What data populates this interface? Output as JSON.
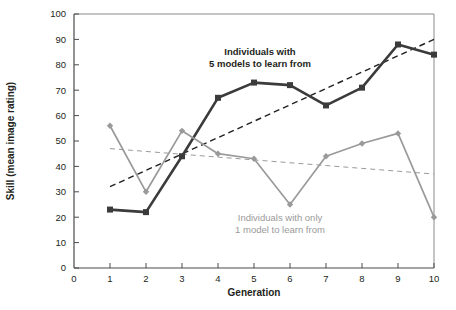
{
  "chart_data": {
    "type": "line",
    "title": "",
    "xlabel": "Generation",
    "ylabel": "Skill (mean image rating)",
    "x": [
      1,
      2,
      3,
      4,
      5,
      6,
      7,
      8,
      9,
      10
    ],
    "xlim": [
      0,
      10
    ],
    "ylim": [
      0,
      100
    ],
    "xticks": [
      "0",
      "1",
      "2",
      "3",
      "4",
      "5",
      "6",
      "7",
      "8",
      "9",
      "10"
    ],
    "yticks": [
      "0",
      "10",
      "20",
      "30",
      "40",
      "50",
      "60",
      "70",
      "80",
      "90",
      "100"
    ],
    "grid": false,
    "legend_position": "inline-annotations",
    "series": [
      {
        "name": "Individuals with 5 models to learn from",
        "color": "#3b3b3b",
        "marker": "square",
        "values": [
          23,
          22,
          44,
          67,
          73,
          72,
          64,
          71,
          88,
          84
        ]
      },
      {
        "name": "Individuals with only 1 model to learn from",
        "color": "#9a9a9a",
        "marker": "diamond",
        "values": [
          56,
          30,
          54,
          45,
          43,
          25,
          44,
          49,
          53,
          20
        ]
      }
    ],
    "trendlines": [
      {
        "name": "trend-5-models",
        "color": "#231f20",
        "style": "dashed",
        "x_start": 1,
        "y_start": 32,
        "x_end": 10,
        "y_end": 90
      },
      {
        "name": "trend-1-model",
        "color": "#9a9a9a",
        "style": "dashed",
        "x_start": 1,
        "y_start": 47,
        "x_end": 10,
        "y_end": 37
      }
    ],
    "annotations": [
      {
        "name": "annotation-five-models",
        "lines": [
          "Individuals with",
          "5 models to learn from"
        ],
        "color": "#231f20",
        "x_px": 260,
        "y_px": 55
      },
      {
        "name": "annotation-one-model",
        "lines": [
          "Individuals with only",
          "1 model to learn from"
        ],
        "color": "#9a9a9a",
        "x_px": 280,
        "y_px": 221
      }
    ]
  },
  "axes": {
    "x_title": "Generation",
    "y_title": "Skill (mean image rating)"
  }
}
